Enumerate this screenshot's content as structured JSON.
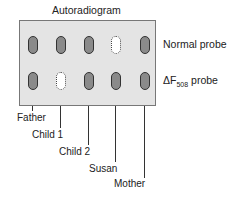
{
  "title": "Autoradiogram",
  "probes": [
    {
      "label": "Normal probe",
      "prefix": "",
      "sub": ""
    },
    {
      "label": " probe",
      "prefix": "ΔF",
      "sub": "508"
    }
  ],
  "lanes": [
    {
      "name": "Father",
      "normal": true,
      "delta": true
    },
    {
      "name": "Child 1",
      "normal": true,
      "delta": false
    },
    {
      "name": "Child 2",
      "normal": true,
      "delta": true
    },
    {
      "name": "Susan",
      "normal": false,
      "delta": true
    },
    {
      "name": "Mother",
      "normal": true,
      "delta": true
    }
  ],
  "colors": {
    "gel": "#e4e4e4",
    "band": "#8a8a8a",
    "outline": "#333333"
  }
}
